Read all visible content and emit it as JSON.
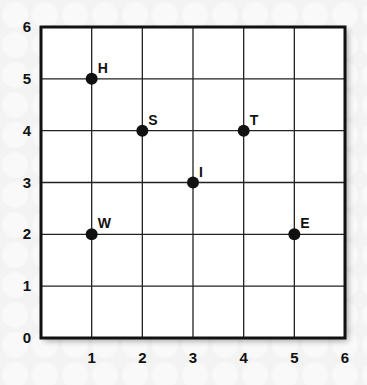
{
  "chart_data": {
    "type": "scatter",
    "title": "",
    "xlabel": "",
    "ylabel": "",
    "xlim": [
      0,
      6
    ],
    "ylim": [
      0,
      6
    ],
    "grid": true,
    "x_ticks": [
      "0",
      "1",
      "2",
      "3",
      "4",
      "5",
      "6"
    ],
    "y_ticks": [
      "0",
      "1",
      "2",
      "3",
      "4",
      "5",
      "6"
    ],
    "points": [
      {
        "label": "H",
        "x": 1,
        "y": 5
      },
      {
        "label": "S",
        "x": 2,
        "y": 4
      },
      {
        "label": "T",
        "x": 4,
        "y": 4
      },
      {
        "label": "I",
        "x": 3,
        "y": 3
      },
      {
        "label": "W",
        "x": 1,
        "y": 2
      },
      {
        "label": "E",
        "x": 5,
        "y": 2
      }
    ]
  },
  "colors": {
    "ink": "#111111",
    "plot_bg": "#ffffff",
    "page_bg": "#f3f3f3"
  }
}
